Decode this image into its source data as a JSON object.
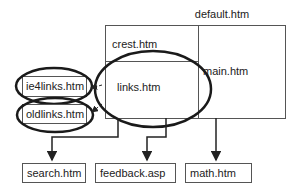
{
  "diagram": {
    "title": "default.htm",
    "frames": {
      "crest": "crest.htm",
      "links": "links.htm",
      "main": "main.htm"
    },
    "linked_pages": {
      "ie4links": "ie4links.htm",
      "oldlinks": "oldlinks.htm"
    },
    "targets": {
      "search": "search.htm",
      "feedback": "feedback.asp",
      "math": "math.htm"
    },
    "colors": {
      "line": "#2a2a2a",
      "box": "#555555",
      "ellipse": "#1a1a1a",
      "text": "#222222"
    }
  }
}
